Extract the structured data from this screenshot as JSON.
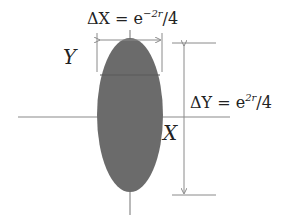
{
  "diagram": {
    "type": "squeezed-state-uncertainty-ellipse",
    "labels": {
      "delta_x": {
        "prefix": "ΔX = e",
        "exponent": "−2r",
        "suffix": "/4"
      },
      "delta_y": {
        "prefix": "ΔY = e",
        "exponent": "2r",
        "suffix": "/4"
      },
      "axis_x": "X",
      "axis_y": "Y"
    },
    "colors": {
      "ellipse_fill": "#6b6b6b",
      "lines": "#8a8a8a",
      "text": "#222222",
      "background": "#ffffff"
    },
    "ellipse": {
      "cx": 130,
      "cy": 115,
      "rx": 33,
      "ry": 77
    }
  }
}
